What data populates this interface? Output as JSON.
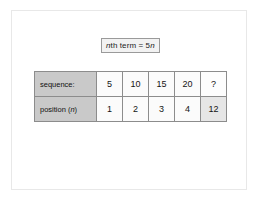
{
  "panel": {
    "background": "#ffffff",
    "border_color": "#e8e8e8"
  },
  "formula": {
    "prefix": "n",
    "body": "th term = 5",
    "suffix": "n",
    "full_text": "nth term = 5n",
    "border_color": "#9a9a9a",
    "background": "#f2f2f2"
  },
  "table": {
    "row_label_background": "#c9c9c9",
    "cell_background": "#fbfbfb",
    "border_color": "#8c8c8c",
    "rows": [
      {
        "label": "sequence:",
        "values": [
          "5",
          "10",
          "15",
          "20"
        ]
      },
      {
        "label_prefix": "position (",
        "label_italic": "n",
        "label_suffix": ")",
        "label": "position (n)",
        "values": [
          "1",
          "2",
          "3",
          "4"
        ]
      }
    ]
  },
  "extra": {
    "question": "?",
    "answer": "12",
    "question_background": "#fdfdfd",
    "answer_background": "#e6e6e6"
  },
  "chart_data": {
    "type": "table",
    "title": "nth term = 5n",
    "categories": [
      "1",
      "2",
      "3",
      "4",
      "12"
    ],
    "series": [
      {
        "name": "sequence:",
        "values": [
          5,
          10,
          15,
          20,
          null
        ]
      },
      {
        "name": "position (n)",
        "values": [
          1,
          2,
          3,
          4,
          12
        ]
      }
    ],
    "xlabel": "position (n)",
    "ylabel": "sequence:",
    "annotations": [
      "nth term = 5n",
      "?"
    ]
  }
}
